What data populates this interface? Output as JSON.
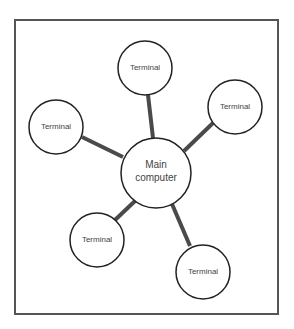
{
  "diagram": {
    "type": "star-network",
    "colors": {
      "frame": "#555555",
      "link": "#4a4a4a",
      "node_stroke": "#222222",
      "node_fill": "#ffffff",
      "text": "#444444"
    },
    "hub": {
      "label_line1": "Main",
      "label_line2": "computer",
      "cx": 156,
      "cy": 173,
      "r": 35
    },
    "terminals": [
      {
        "label": "Terminal",
        "cx": 145,
        "cy": 68,
        "r": 27
      },
      {
        "label": "Terminal",
        "cx": 235,
        "cy": 107,
        "r": 27
      },
      {
        "label": "Terminal",
        "cx": 56,
        "cy": 127,
        "r": 27
      },
      {
        "label": "Terminal",
        "cx": 97,
        "cy": 240,
        "r": 27
      },
      {
        "label": "Terminal",
        "cx": 203,
        "cy": 272,
        "r": 27
      }
    ]
  }
}
